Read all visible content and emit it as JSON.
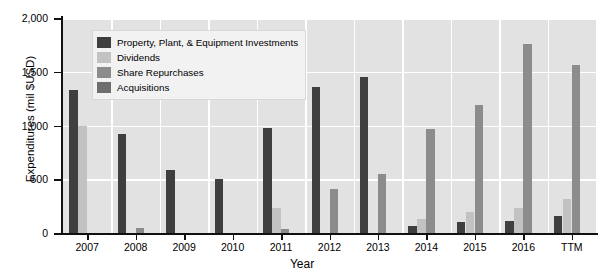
{
  "chart_data": {
    "type": "bar",
    "title": "",
    "xlabel": "Year",
    "ylabel": "Expenditures (mil $USD)",
    "ylim": [
      0,
      2000
    ],
    "yticks": [
      0,
      500,
      1000,
      1500,
      2000
    ],
    "ytick_labels": [
      "0",
      "500",
      "1,000",
      "1,500",
      "2,000"
    ],
    "grid": true,
    "legend_position": "upper-left-inside",
    "categories": [
      "2007",
      "2008",
      "2009",
      "2010",
      "2011",
      "2012",
      "2013",
      "2014",
      "2015",
      "2016",
      "TTM"
    ],
    "series": [
      {
        "name": "Property, Plant, & Equipment Investments",
        "color": "#3f3f3f",
        "values": [
          1330,
          925,
          590,
          505,
          975,
          1355,
          1455,
          65,
          105,
          115,
          160
        ]
      },
      {
        "name": "Dividends",
        "color": "#c2c2c2",
        "values": [
          1000,
          0,
          0,
          0,
          235,
          0,
          0,
          135,
          195,
          230,
          320
        ]
      },
      {
        "name": "Share Repurchases",
        "color": "#8c8c8c",
        "values": [
          0,
          50,
          0,
          0,
          35,
          405,
          550,
          965,
          1195,
          1760,
          1565
        ]
      },
      {
        "name": "Acquisitions",
        "color": "#6e6e6e",
        "values": [
          0,
          0,
          0,
          0,
          0,
          0,
          0,
          0,
          0,
          0,
          0
        ]
      }
    ]
  },
  "legend": {
    "items": [
      {
        "label": "Property, Plant, & Equipment Investments",
        "color": "#3f3f3f",
        "icon": "legend-swatch-ppe"
      },
      {
        "label": "Dividends",
        "color": "#c2c2c2",
        "icon": "legend-swatch-dividends"
      },
      {
        "label": "Share Repurchases",
        "color": "#8c8c8c",
        "icon": "legend-swatch-share-repurchases"
      },
      {
        "label": "Acquisitions",
        "color": "#6e6e6e",
        "icon": "legend-swatch-acquisitions"
      }
    ]
  },
  "axes": {
    "x_title": "Year",
    "y_title": "Expenditures (mil $USD)"
  },
  "colors": {
    "plot_background": "#e2e2e2",
    "gridline": "#ffffff",
    "axis": "#111111",
    "legend_background": "#f2f2f2"
  }
}
